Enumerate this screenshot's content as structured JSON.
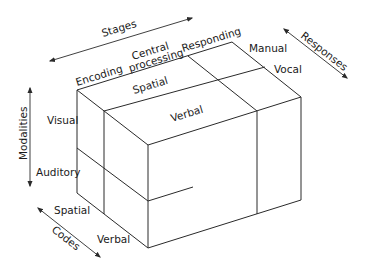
{
  "diagram": {
    "dimensions": {
      "stages": {
        "label": "Stages",
        "levels": [
          "Encoding",
          "Central",
          "processing",
          "Responding"
        ]
      },
      "responses": {
        "label": "Responses",
        "levels": [
          "Manual",
          "Vocal"
        ]
      },
      "modalities": {
        "label": "Modalities",
        "levels": [
          "Visual",
          "Auditory"
        ]
      },
      "codes": {
        "label": "Codes",
        "levels": [
          "Spatial",
          "Verbal"
        ]
      }
    },
    "top_face_labels": {
      "spatial": "Spatial",
      "verbal": "Verbal"
    },
    "colors": {
      "line": "#2a2a2a",
      "text": "#1a1a1a",
      "background": "#ffffff"
    }
  }
}
